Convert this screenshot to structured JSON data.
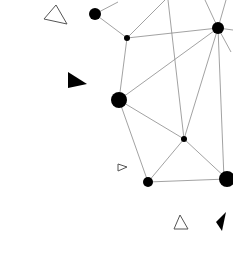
{
  "canvas": {
    "width": 233,
    "height": 279,
    "background": "#ffffff"
  },
  "colors": {
    "node": "#000000",
    "edge": "#8a8a8a",
    "outline": "#555555"
  },
  "nodes": [
    {
      "id": "a",
      "x": 95,
      "y": 14,
      "r": 6
    },
    {
      "id": "b",
      "x": 127,
      "y": 38,
      "r": 3
    },
    {
      "id": "c",
      "x": 218,
      "y": 28,
      "r": 6
    },
    {
      "id": "d",
      "x": 119,
      "y": 100,
      "r": 8
    },
    {
      "id": "e",
      "x": 184,
      "y": 139,
      "r": 3
    },
    {
      "id": "f",
      "x": 148,
      "y": 182,
      "r": 5
    },
    {
      "id": "g",
      "x": 227,
      "y": 179,
      "r": 8
    }
  ],
  "edges": [
    [
      95,
      14,
      118,
      2
    ],
    [
      95,
      14,
      127,
      38
    ],
    [
      127,
      38,
      165,
      0
    ],
    [
      127,
      38,
      218,
      28
    ],
    [
      127,
      38,
      119,
      100
    ],
    [
      168,
      0,
      184,
      139
    ],
    [
      218,
      28,
      205,
      0
    ],
    [
      218,
      28,
      226,
      0
    ],
    [
      218,
      28,
      233,
      30
    ],
    [
      218,
      28,
      231,
      52
    ],
    [
      218,
      28,
      119,
      100
    ],
    [
      218,
      28,
      184,
      139
    ],
    [
      218,
      28,
      224,
      179
    ],
    [
      119,
      100,
      184,
      139
    ],
    [
      119,
      100,
      148,
      182
    ],
    [
      184,
      139,
      148,
      182
    ],
    [
      184,
      139,
      227,
      179
    ],
    [
      148,
      182,
      227,
      179
    ]
  ],
  "triangles": [
    {
      "points": "44,19 56,5 67,24",
      "fill": "none"
    },
    {
      "points": "68,72 68,88 87,84",
      "fill": "#000000"
    },
    {
      "points": "118,164 118,171 127,167",
      "fill": "none"
    },
    {
      "points": "174,229 180,215 188,229",
      "fill": "none"
    },
    {
      "points": "216,222 226,212 222,231",
      "fill": "#000000"
    }
  ]
}
